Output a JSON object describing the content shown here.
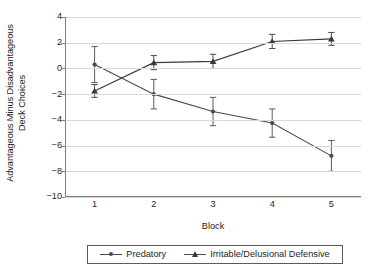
{
  "chart_data": {
    "type": "line",
    "title": "",
    "xlabel": "Block",
    "ylabel_line1": "Advantageous Minus Disadvantageous",
    "ylabel_line2": "Deck Choices",
    "categories": [
      "1",
      "2",
      "3",
      "4",
      "5"
    ],
    "x": [
      1,
      2,
      3,
      4,
      5
    ],
    "xlim": [
      0.5,
      5.5
    ],
    "ylim": [
      -10,
      4
    ],
    "yticks": [
      "4",
      "2",
      "0",
      "-2",
      "-4",
      "-6",
      "-8",
      "-10"
    ],
    "ytick_values": [
      4,
      2,
      0,
      -2,
      -4,
      -6,
      -8,
      -10
    ],
    "grid": true,
    "grid_axis": "y",
    "legend_position": "bottom",
    "series": [
      {
        "name": "Predatory",
        "marker": "dot",
        "color": "#4a4a4a",
        "values": [
          0.3,
          -2.0,
          -3.35,
          -4.25,
          -6.8
        ],
        "errors_upper": [
          1.4,
          1.15,
          1.1,
          1.1,
          1.2
        ],
        "errors_lower": [
          1.4,
          1.15,
          1.1,
          1.1,
          1.2
        ]
      },
      {
        "name": "Irritable/Delusional Defensive",
        "marker": "triangle",
        "color": "#3a3a3a",
        "values": [
          -1.75,
          0.45,
          0.55,
          2.1,
          2.3
        ],
        "errors_upper": [
          0.5,
          0.55,
          0.55,
          0.55,
          0.5
        ],
        "errors_lower": [
          0.5,
          0.55,
          0.55,
          0.55,
          0.5
        ]
      }
    ]
  },
  "legend": {
    "entries": [
      {
        "label": "Predatory"
      },
      {
        "label": "Irritable/Delusional Defensive"
      }
    ]
  },
  "colors": {
    "axis": "#808080",
    "grid": "#d9d9d9",
    "text": "#231f20",
    "series_predatory": "#4a4a4a",
    "series_irritable": "#3a3a3a",
    "background": "#ffffff"
  }
}
